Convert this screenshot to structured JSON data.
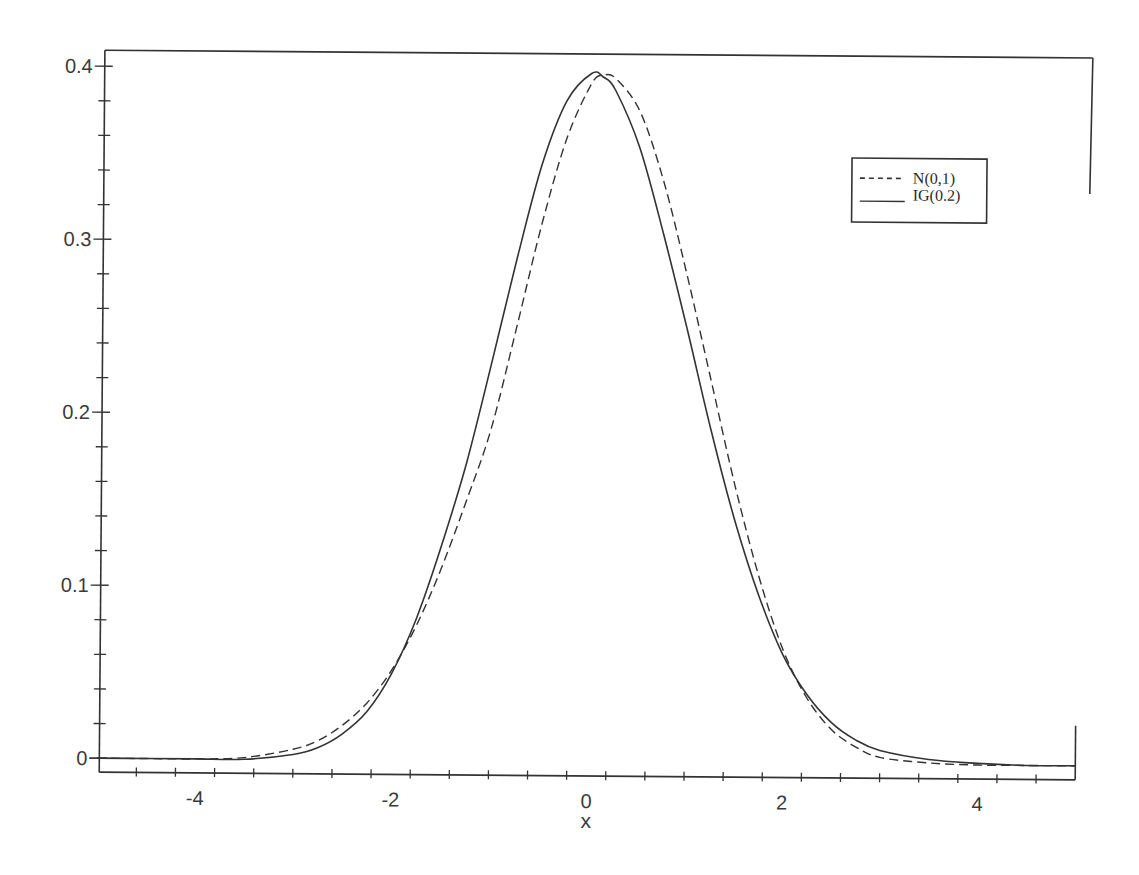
{
  "chart_data": {
    "type": "line",
    "title": "",
    "xlabel": "x",
    "ylabel": "",
    "xlim": [
      -5,
      5
    ],
    "ylim": [
      0,
      0.41
    ],
    "grid": false,
    "legend_position": "upper right (inside)",
    "x_ticks": [
      -4,
      -2,
      0,
      2,
      4
    ],
    "x_tick_labels": [
      "-4",
      "-2",
      "0",
      "2",
      "4"
    ],
    "x_minor_step": 0.4,
    "y_ticks": [
      0,
      0.1,
      0.2,
      0.3,
      0.4
    ],
    "y_tick_labels": [
      "0",
      "0.1",
      "0.2",
      "0.3",
      "0.4"
    ],
    "y_minor_step": 0.02,
    "series": [
      {
        "name": "N(0,1)",
        "style": "dashed",
        "color": "#333333",
        "x": [
          -5,
          -4.5,
          -4,
          -3.5,
          -3,
          -2.75,
          -2.5,
          -2.25,
          -2,
          -1.75,
          -1.5,
          -1.25,
          -1,
          -0.75,
          -0.5,
          -0.25,
          0,
          0.12,
          0.25,
          0.5,
          0.75,
          1,
          1.25,
          1.5,
          1.75,
          2,
          2.25,
          2.5,
          2.75,
          3,
          3.5,
          4,
          4.5,
          5
        ],
        "y": [
          0.0,
          0.0,
          0.0,
          0.001,
          0.006,
          0.011,
          0.02,
          0.033,
          0.052,
          0.078,
          0.111,
          0.15,
          0.192,
          0.25,
          0.31,
          0.36,
          0.392,
          0.397,
          0.395,
          0.376,
          0.335,
          0.28,
          0.22,
          0.16,
          0.108,
          0.066,
          0.038,
          0.02,
          0.01,
          0.004,
          0.001,
          0.0,
          0.0,
          0.0
        ]
      },
      {
        "name": "IG(0.2)",
        "style": "solid",
        "color": "#333333",
        "x": [
          -5,
          -4.5,
          -4,
          -3.5,
          -3,
          -2.75,
          -2.5,
          -2.25,
          -2,
          -1.75,
          -1.5,
          -1.25,
          -1,
          -0.75,
          -0.5,
          -0.25,
          0,
          0.12,
          0.25,
          0.5,
          0.75,
          1,
          1.25,
          1.5,
          1.75,
          2,
          2.25,
          2.5,
          2.75,
          3,
          3.5,
          4,
          4.5,
          5
        ],
        "y": [
          0.0,
          0.0,
          0.0,
          0.0,
          0.003,
          0.007,
          0.015,
          0.028,
          0.05,
          0.082,
          0.124,
          0.172,
          0.23,
          0.29,
          0.345,
          0.382,
          0.398,
          0.396,
          0.388,
          0.355,
          0.305,
          0.25,
          0.192,
          0.14,
          0.097,
          0.063,
          0.04,
          0.024,
          0.014,
          0.008,
          0.003,
          0.001,
          0.0,
          0.0
        ]
      }
    ]
  },
  "legend": {
    "items": [
      {
        "label": "N(0,1)",
        "style": "dashed"
      },
      {
        "label": "IG(0.2)",
        "style": "solid"
      }
    ]
  },
  "axes": {
    "xlabel": "x"
  },
  "colors": {
    "ink": "#333333",
    "background": "#ffffff"
  }
}
